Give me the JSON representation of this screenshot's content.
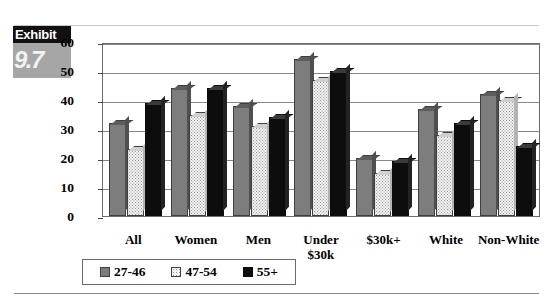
{
  "exhibit": {
    "word": "Exhibit",
    "number": "9.7"
  },
  "chart_data": {
    "type": "bar",
    "title": "",
    "subtitle": "",
    "xlabel": "",
    "ylabel": "",
    "ylim": [
      0,
      60
    ],
    "yticks": [
      0,
      10,
      20,
      30,
      40,
      50,
      60
    ],
    "ytick_labels": [
      "0",
      "10",
      "20",
      "30",
      "40",
      "50",
      "60"
    ],
    "grid": true,
    "legend_position": "bottom",
    "categories": [
      "All",
      "Women",
      "Men",
      "Under $30k",
      "$30k+",
      "White",
      "Non-White"
    ],
    "category_lines": [
      [
        "All"
      ],
      [
        "Women"
      ],
      [
        "Men"
      ],
      [
        "Under",
        "$30k"
      ],
      [
        "$30k+"
      ],
      [
        "White"
      ],
      [
        "Non-White"
      ]
    ],
    "series": [
      {
        "name": "27-46",
        "color": "#7d7d7d",
        "values": [
          32,
          44,
          38,
          54,
          20,
          37,
          42
        ]
      },
      {
        "name": "47-54",
        "color": "#f2f2f2",
        "values": [
          23,
          35,
          31,
          47,
          15,
          28,
          40
        ]
      },
      {
        "name": "55+",
        "color": "#0d0d0d",
        "values": [
          39,
          44,
          34,
          50,
          19,
          32,
          24
        ]
      }
    ]
  }
}
